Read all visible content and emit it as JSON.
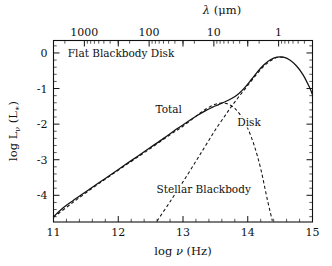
{
  "chart_data": {
    "type": "line",
    "title": "Flat Blackbody Disk",
    "xlabel": "log ν (Hz)",
    "ylabel": "log Lν (L∗)",
    "xlim": [
      11,
      15
    ],
    "ylim": [
      -4.75,
      0.35
    ],
    "grid": false,
    "legend_position": "inline-annotations",
    "xticks": [
      "11",
      "12",
      "13",
      "14",
      "15"
    ],
    "xtick_values": [
      11,
      12,
      13,
      14,
      15
    ],
    "yticks": [
      "0",
      "-1",
      "-2",
      "-3",
      "-4"
    ],
    "ytick_values": [
      0,
      -1,
      -2,
      -3,
      -4
    ],
    "secondary_axis": {
      "position": "top",
      "label": "λ (μm)",
      "ticks": [
        "1000",
        "100",
        "10",
        "1"
      ],
      "tick_values": [
        1000,
        100,
        10,
        1
      ]
    },
    "series": [
      {
        "name": "Total",
        "style": "solid",
        "x": [
          11.0,
          11.15,
          11.3,
          11.5,
          11.7,
          11.9,
          12.1,
          12.3,
          12.5,
          12.7,
          12.9,
          13.05,
          13.2,
          13.35,
          13.45,
          13.55,
          13.65,
          13.75,
          13.85,
          13.95,
          14.05,
          14.15,
          14.25,
          14.35,
          14.45,
          14.55,
          14.65,
          14.75,
          14.85,
          14.95,
          15.0
        ],
        "y": [
          -4.6,
          -4.35,
          -4.15,
          -3.9,
          -3.65,
          -3.4,
          -3.15,
          -2.9,
          -2.65,
          -2.4,
          -2.14,
          -1.96,
          -1.78,
          -1.62,
          -1.53,
          -1.45,
          -1.37,
          -1.28,
          -1.16,
          -0.98,
          -0.76,
          -0.53,
          -0.33,
          -0.19,
          -0.12,
          -0.12,
          -0.2,
          -0.36,
          -0.6,
          -0.95,
          -1.17
        ]
      },
      {
        "name": "Disk",
        "style": "dashed",
        "x": [
          11.0,
          11.3,
          11.6,
          11.9,
          12.2,
          12.5,
          12.8,
          13.0,
          13.2,
          13.35,
          13.5,
          13.6,
          13.7,
          13.8,
          13.9,
          14.0,
          14.1,
          14.2,
          14.3,
          14.38
        ],
        "y": [
          -4.62,
          -4.2,
          -3.8,
          -3.42,
          -3.05,
          -2.68,
          -2.3,
          -2.06,
          -1.78,
          -1.58,
          -1.44,
          -1.41,
          -1.44,
          -1.56,
          -1.78,
          -2.12,
          -2.6,
          -3.25,
          -4.1,
          -4.72
        ]
      },
      {
        "name": "Stellar Blackbody",
        "style": "dashed",
        "x": [
          12.6,
          12.8,
          13.0,
          13.2,
          13.35,
          13.5,
          13.65,
          13.75,
          13.85,
          13.95,
          14.05,
          14.15,
          14.25,
          14.35,
          14.45,
          14.55
        ],
        "y": [
          -4.72,
          -4.18,
          -3.62,
          -3.04,
          -2.6,
          -2.16,
          -1.76,
          -1.5,
          -1.26,
          -1.03,
          -0.8,
          -0.57,
          -0.37,
          -0.22,
          -0.13,
          -0.12
        ]
      }
    ],
    "annotations": [
      {
        "text": "Flat Blackbody Disk",
        "x": 11.22,
        "y": 0.0,
        "align": "left"
      },
      {
        "text": "Total",
        "x": 12.78,
        "y": -1.58,
        "align": "center"
      },
      {
        "text": "Disk",
        "x": 14.02,
        "y": -1.93,
        "align": "center"
      },
      {
        "text": "Stellar Blackbody",
        "x": 13.32,
        "y": -3.82,
        "align": "center"
      }
    ]
  }
}
